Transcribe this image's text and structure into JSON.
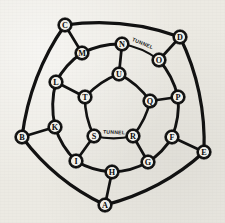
{
  "figure": {
    "background_color": "#eceae3",
    "ink_color": "#121212",
    "node_fill_color": "#f3f2ec",
    "width": 225,
    "height": 223
  },
  "rings": {
    "outer": {
      "name": "outer-ring",
      "radius": 96,
      "count": 5
    },
    "middle": {
      "name": "middle-ring",
      "radius": 62,
      "count": 10
    },
    "inner": {
      "name": "inner-ring",
      "radius": 30,
      "count": 5
    }
  },
  "nodes": [
    {
      "id": "A",
      "label": "A",
      "ring": "outer",
      "x": 105,
      "y": 205
    },
    {
      "id": "B",
      "label": "B",
      "ring": "outer",
      "x": 22,
      "y": 137
    },
    {
      "id": "C",
      "label": "C",
      "ring": "outer",
      "x": 65,
      "y": 25
    },
    {
      "id": "D",
      "label": "D",
      "ring": "outer",
      "x": 180,
      "y": 37
    },
    {
      "id": "E",
      "label": "E",
      "ring": "outer",
      "x": 204,
      "y": 152
    },
    {
      "id": "F",
      "label": "F",
      "ring": "middle",
      "x": 172,
      "y": 137
    },
    {
      "id": "G",
      "label": "G",
      "ring": "middle",
      "x": 148,
      "y": 162
    },
    {
      "id": "H",
      "label": "H",
      "ring": "middle",
      "x": 112,
      "y": 172
    },
    {
      "id": "I",
      "label": "I",
      "ring": "middle",
      "x": 76,
      "y": 161
    },
    {
      "id": "K",
      "label": "K",
      "ring": "middle",
      "x": 55,
      "y": 127
    },
    {
      "id": "L",
      "label": "L",
      "ring": "middle",
      "x": 56,
      "y": 82
    },
    {
      "id": "M",
      "label": "M",
      "ring": "middle",
      "x": 82,
      "y": 53
    },
    {
      "id": "N",
      "label": "N",
      "ring": "middle",
      "x": 122,
      "y": 44
    },
    {
      "id": "O",
      "label": "O",
      "ring": "middle",
      "x": 159,
      "y": 60
    },
    {
      "id": "P",
      "label": "P",
      "ring": "middle",
      "x": 178,
      "y": 97
    },
    {
      "id": "Q",
      "label": "Q",
      "ring": "inner",
      "x": 150,
      "y": 101
    },
    {
      "id": "R",
      "label": "R",
      "ring": "inner",
      "x": 133,
      "y": 136
    },
    {
      "id": "S",
      "label": "S",
      "ring": "inner",
      "x": 94,
      "y": 136
    },
    {
      "id": "T",
      "label": "T",
      "ring": "inner",
      "x": 85,
      "y": 97
    },
    {
      "id": "U",
      "label": "U",
      "ring": "inner",
      "x": 119,
      "y": 74
    }
  ],
  "edges": [
    {
      "from": "C",
      "to": "D",
      "kind": "outer",
      "curve": "arc"
    },
    {
      "from": "D",
      "to": "E",
      "kind": "outer",
      "curve": "arc"
    },
    {
      "from": "E",
      "to": "A",
      "kind": "outer",
      "curve": "arc"
    },
    {
      "from": "A",
      "to": "B",
      "kind": "outer",
      "curve": "arc"
    },
    {
      "from": "B",
      "to": "C",
      "kind": "outer",
      "curve": "arc"
    },
    {
      "from": "N",
      "to": "O",
      "kind": "tunnel",
      "curve": "arc",
      "label": "TUNNEL"
    },
    {
      "from": "O",
      "to": "P",
      "kind": "mid",
      "curve": "arc"
    },
    {
      "from": "P",
      "to": "F",
      "kind": "mid",
      "curve": "arc"
    },
    {
      "from": "F",
      "to": "G",
      "kind": "mid",
      "curve": "arc"
    },
    {
      "from": "G",
      "to": "H",
      "kind": "mid",
      "curve": "arc"
    },
    {
      "from": "H",
      "to": "I",
      "kind": "mid",
      "curve": "arc"
    },
    {
      "from": "I",
      "to": "K",
      "kind": "mid",
      "curve": "arc"
    },
    {
      "from": "K",
      "to": "L",
      "kind": "mid",
      "curve": "arc"
    },
    {
      "from": "L",
      "to": "M",
      "kind": "mid",
      "curve": "arc"
    },
    {
      "from": "M",
      "to": "N",
      "kind": "mid",
      "curve": "arc"
    },
    {
      "from": "U",
      "to": "Q",
      "kind": "inner",
      "curve": "arc"
    },
    {
      "from": "Q",
      "to": "R",
      "kind": "inner",
      "curve": "arc"
    },
    {
      "from": "R",
      "to": "S",
      "kind": "tunnel",
      "curve": "arc",
      "label": "TUNNEL"
    },
    {
      "from": "S",
      "to": "T",
      "kind": "inner",
      "curve": "arc"
    },
    {
      "from": "T",
      "to": "U",
      "kind": "inner",
      "curve": "arc"
    },
    {
      "from": "C",
      "to": "M",
      "kind": "spoke",
      "curve": "line"
    },
    {
      "from": "D",
      "to": "O",
      "kind": "spoke",
      "curve": "line"
    },
    {
      "from": "E",
      "to": "F",
      "kind": "spoke",
      "curve": "line"
    },
    {
      "from": "A",
      "to": "H",
      "kind": "spoke",
      "curve": "line"
    },
    {
      "from": "B",
      "to": "K",
      "kind": "spoke",
      "curve": "line"
    },
    {
      "from": "N",
      "to": "U",
      "kind": "spoke",
      "curve": "line"
    },
    {
      "from": "P",
      "to": "Q",
      "kind": "spoke",
      "curve": "line"
    },
    {
      "from": "G",
      "to": "R",
      "kind": "spoke",
      "curve": "line"
    },
    {
      "from": "I",
      "to": "S",
      "kind": "spoke",
      "curve": "line"
    },
    {
      "from": "L",
      "to": "T",
      "kind": "spoke",
      "curve": "line"
    }
  ],
  "tunnel_labels": [
    {
      "text": "TUNNEL",
      "x": 142,
      "y": 45,
      "rotate": 22
    },
    {
      "text": "TUNNEL",
      "x": 114,
      "y": 134,
      "rotate": 2
    }
  ],
  "node_radius": 6.2
}
